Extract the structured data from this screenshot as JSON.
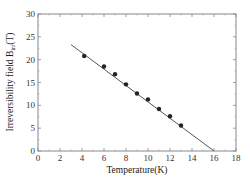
{
  "chart_data": {
    "type": "scatter",
    "title": "",
    "xlabel": "Temperature(K)",
    "ylabel": "Irreversibility field B",
    "ylabel_sub": "irr",
    "ylabel_suffix": "(T)",
    "xlim": [
      0,
      18
    ],
    "ylim": [
      0,
      30
    ],
    "xticks": [
      0,
      2,
      4,
      6,
      8,
      10,
      12,
      14,
      16,
      18
    ],
    "yticks": [
      0,
      5,
      10,
      15,
      20,
      25,
      30
    ],
    "grid": false,
    "legend": null,
    "series": [
      {
        "name": "data",
        "type": "scatter",
        "marker": "circle",
        "color": "#222222",
        "x": [
          4.2,
          6.0,
          7.0,
          8.0,
          9.0,
          10.0,
          11.0,
          12.0,
          13.0
        ],
        "y": [
          20.8,
          18.5,
          16.8,
          14.6,
          12.6,
          11.3,
          9.2,
          7.6,
          5.6
        ]
      },
      {
        "name": "linear fit",
        "type": "line",
        "color": "#555555",
        "x": [
          3.0,
          16.0
        ],
        "y": [
          23.3,
          0.0
        ]
      }
    ]
  }
}
